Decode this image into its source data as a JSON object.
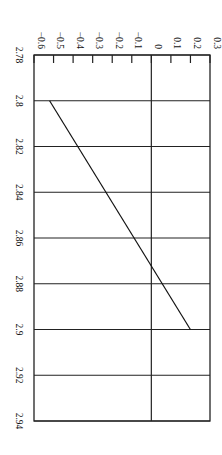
{
  "chart_data": {
    "type": "line",
    "orientation": "rotated-90-clockwise",
    "title": "",
    "xlabel": "",
    "ylabel": "",
    "x_ticks": [
      "2.78",
      "2.8",
      "2.82",
      "2.84",
      "2.86",
      "2.88",
      "2.9",
      "2.92",
      "2.94"
    ],
    "y_ticks": [
      "-0.6",
      "-0.5",
      "-0.4",
      "-0.3",
      "-0.2",
      "-0.1",
      "0",
      "0.1",
      "0.2",
      "0.3"
    ],
    "xlim": [
      2.78,
      2.94
    ],
    "ylim": [
      -0.6,
      0.3
    ],
    "grid": true,
    "legend": null,
    "series": [
      {
        "name": "series-1",
        "x": [
          2.8,
          2.9
        ],
        "y": [
          -0.52,
          0.2
        ]
      }
    ]
  },
  "colors": {
    "line": "#111111",
    "grid": "#222222",
    "background": "#ffffff"
  }
}
